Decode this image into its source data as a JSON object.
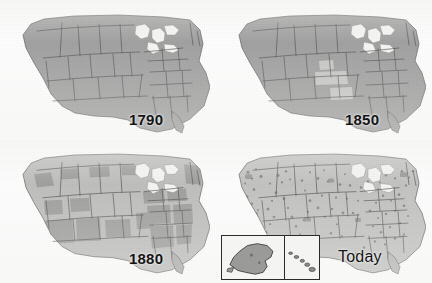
{
  "figure": {
    "kind": "map-series",
    "panel_count": 4,
    "layout": "2x2 grid",
    "colors": {
      "background": "#ffffff",
      "land_dark": "#8c8c8c",
      "land_mid": "#9e9e9e",
      "land_light": "#b4b4b2",
      "water": "#f2f2f0",
      "border_line": "#2b2b2b",
      "caption_text": "#141414",
      "settlement_dots": "#6e6e6e"
    }
  },
  "panels": [
    {
      "id": "panel-1790",
      "caption": "1790",
      "position": "top-left",
      "fill_style": "uniform dark gray across the conterminous United States",
      "has_inset": false,
      "inset_regions": []
    },
    {
      "id": "panel-1850",
      "caption": "1850",
      "position": "top-right",
      "fill_style": "dark gray with a few lighter unsettled territory patches in the central plains",
      "has_inset": false,
      "inset_regions": []
    },
    {
      "id": "panel-1880",
      "caption": "1880",
      "position": "bottom-left",
      "fill_style": "lighter gray with mottled darker patches across the interior west",
      "has_inset": false,
      "inset_regions": []
    },
    {
      "id": "panel-today",
      "caption": "Today",
      "position": "bottom-right",
      "fill_style": "light gray with dense dark speckled settlement clusters, heaviest in the west and along coasts",
      "has_inset": true,
      "inset_regions": [
        "Alaska",
        "Hawaii"
      ]
    }
  ],
  "map_data": {
    "projection_note": "conterminous United States outline with state boundary lines",
    "features": [
      "Great Lakes shown in white",
      "Gulf of Mexico coastline",
      "Atlantic seaboard",
      "Pacific coastline",
      "Florida peninsula",
      "Chesapeake Bay",
      "Long Island",
      "Cape Cod",
      "Puget Sound"
    ],
    "inset_features": [
      "Alaska outline",
      "Hawaiian island chain"
    ]
  }
}
